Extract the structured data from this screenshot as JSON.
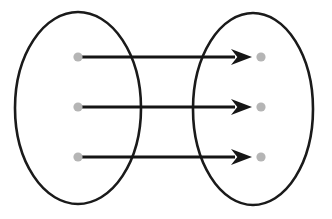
{
  "diagram": {
    "kind": "set-mapping-diagram",
    "canvas": {
      "width": 332,
      "height": 219,
      "background": "#ffffff"
    },
    "colors": {
      "ellipse_stroke": "#1a1a1a",
      "dot_fill": "#b5b5b5",
      "arrow_stroke": "#151515",
      "arrow_head_fill": "#151515",
      "background": "#ffffff"
    },
    "sets": [
      {
        "name": "domain-set",
        "label": "",
        "cx": 78,
        "cy": 108,
        "rx": 63,
        "ry": 96,
        "stroke_width": 2.6
      },
      {
        "name": "codomain-set",
        "label": "",
        "cx": 253,
        "cy": 109,
        "rx": 60,
        "ry": 96,
        "stroke_width": 2.6
      }
    ],
    "dots": {
      "radius": 4.6,
      "left": [
        {
          "label": "",
          "cx": 78,
          "cy": 57
        },
        {
          "label": "",
          "cx": 78,
          "cy": 107
        },
        {
          "label": "",
          "cx": 78,
          "cy": 157
        }
      ],
      "right": [
        {
          "label": "",
          "cx": 261,
          "cy": 57
        },
        {
          "label": "",
          "cx": 261,
          "cy": 107
        },
        {
          "label": "",
          "cx": 261,
          "cy": 157
        }
      ]
    },
    "arrows": [
      {
        "label": "",
        "x1": 80,
        "y1": 57,
        "x2": 252,
        "y2": 57,
        "width": 3.0,
        "head_length": 21,
        "head_width": 16
      },
      {
        "label": "",
        "x1": 80,
        "y1": 107,
        "x2": 252,
        "y2": 107,
        "width": 3.0,
        "head_length": 21,
        "head_width": 16
      },
      {
        "label": "",
        "x1": 80,
        "y1": 157,
        "x2": 252,
        "y2": 157,
        "width": 3.0,
        "head_length": 21,
        "head_width": 16
      }
    ]
  }
}
